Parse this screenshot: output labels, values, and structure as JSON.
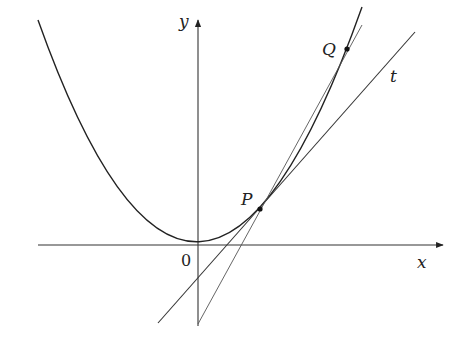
{
  "diagram": {
    "labels": {
      "y_axis": "y",
      "x_axis": "x",
      "origin": "0",
      "point_p": "P",
      "point_q": "Q",
      "tangent": "t"
    },
    "colors": {
      "stroke": "#333333",
      "background": "#ffffff"
    }
  }
}
